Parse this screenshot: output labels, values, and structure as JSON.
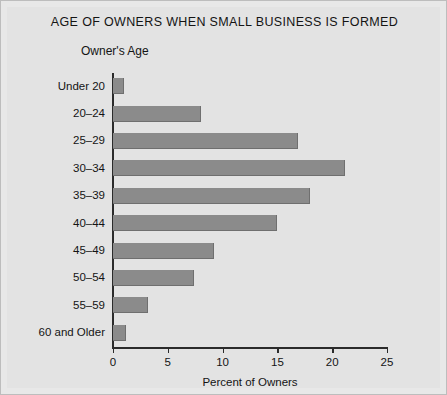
{
  "chart_data": {
    "type": "bar",
    "orientation": "horizontal",
    "title": "AGE OF OWNERS WHEN SMALL BUSINESS IS FORMED",
    "xlabel": "Percent of Owners",
    "ylabel": "Owner's Age",
    "categories": [
      "Under 20",
      "20–24",
      "25–29",
      "30–34",
      "35–39",
      "40–44",
      "45–49",
      "50–54",
      "55–59",
      "60 and Older"
    ],
    "values": [
      1.0,
      8.0,
      16.9,
      21.2,
      18.0,
      15.0,
      9.2,
      7.4,
      3.2,
      1.2
    ],
    "xlim": [
      0,
      25
    ],
    "xticks": [
      0,
      5,
      10,
      15,
      20,
      25
    ],
    "xtick_labels": [
      "0",
      "5",
      "10",
      "15",
      "20",
      "25"
    ],
    "grid": false,
    "legend": false,
    "bar_color": "#8b8b8b",
    "axis_color": "#2b2b2b",
    "background_color": "#e3e3e3"
  }
}
